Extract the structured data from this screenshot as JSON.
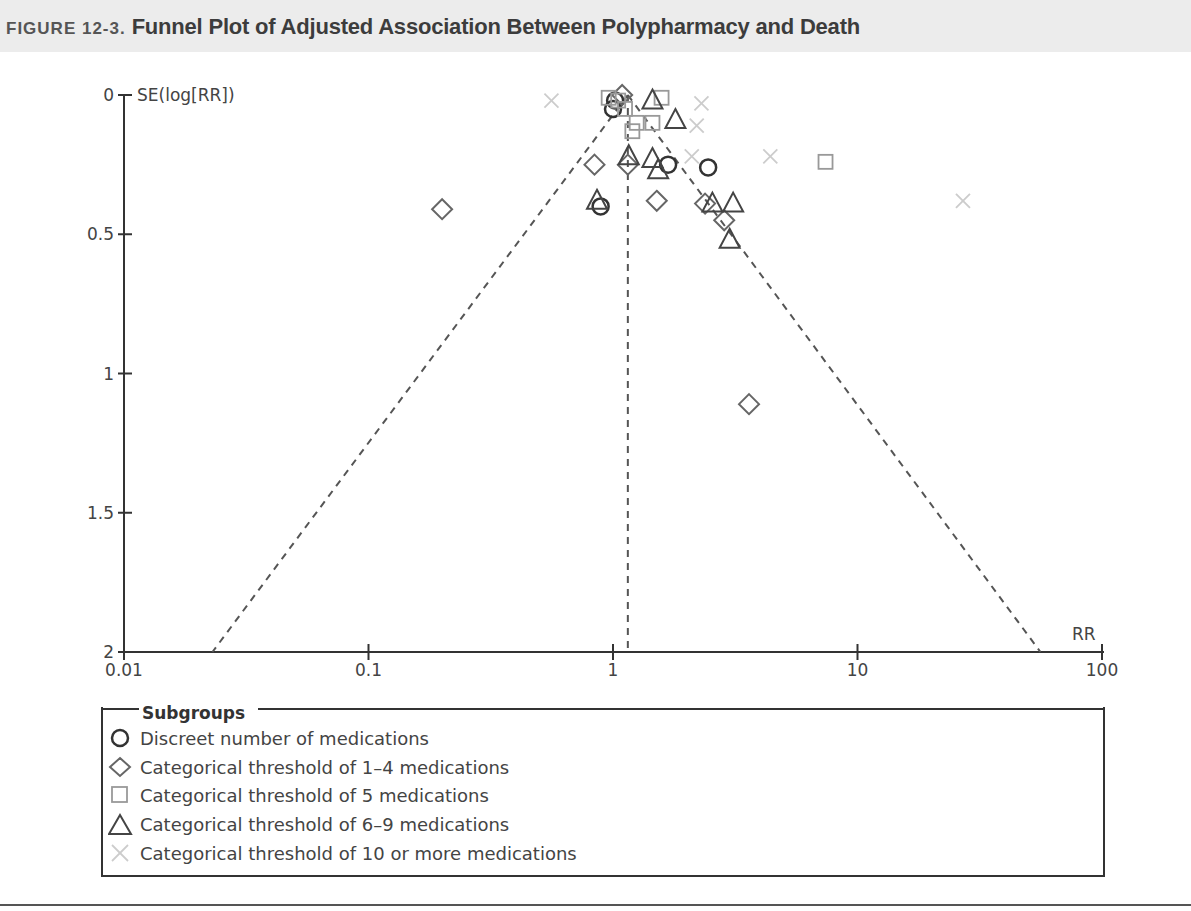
{
  "figure": {
    "label": "FIGURE 12-3.",
    "title": "Funnel Plot of Adjusted Association Between Polypharmacy and Death"
  },
  "axes": {
    "y_label": "SE(log[RR])",
    "x_label": "RR",
    "y_ticks": [
      "0",
      "0.5",
      "1",
      "1.5",
      "2"
    ],
    "x_ticks": [
      "0.01",
      "0.1",
      "1",
      "10",
      "100"
    ]
  },
  "legend": {
    "title": "Subgroups",
    "items": [
      {
        "symbol": "circle",
        "label": "Discreet number of medications",
        "color": "#333333"
      },
      {
        "symbol": "diamond",
        "label": "Categorical threshold of 1–4 medications",
        "color": "#666666"
      },
      {
        "symbol": "square",
        "label": "Categorical threshold of 5 medications",
        "color": "#999999"
      },
      {
        "symbol": "triangle",
        "label": "Categorical threshold of 6–9 medications",
        "color": "#444444"
      },
      {
        "symbol": "cross",
        "label": "Categorical threshold of 10 or more medications",
        "color": "#cccccc"
      }
    ]
  },
  "chart_data": {
    "type": "scatter",
    "title": "Funnel Plot of Adjusted Association Between Polypharmacy and Death",
    "xlabel": "RR",
    "ylabel": "SE(log[RR])",
    "x_scale": "log",
    "xlim": [
      0.01,
      100
    ],
    "ylim": [
      2,
      0
    ],
    "y_inverted": true,
    "x_ticks": [
      0.01,
      0.1,
      1,
      10,
      100
    ],
    "y_ticks": [
      0,
      0.5,
      1,
      1.5,
      2
    ],
    "grid": false,
    "legend_position": "bottom",
    "pooled_estimate_rr": 1.15,
    "funnel_limits": {
      "apex": [
        1.15,
        0
      ],
      "left_at_se2": 0.023,
      "right_at_se2": 56
    },
    "series": [
      {
        "name": "Discreet number of medications",
        "marker": "circle",
        "points": [
          [
            1.0,
            0.05
          ],
          [
            1.02,
            0.02
          ],
          [
            0.89,
            0.4
          ],
          [
            1.68,
            0.25
          ],
          [
            2.45,
            0.26
          ]
        ]
      },
      {
        "name": "Categorical threshold of 1–4 medications",
        "marker": "diamond",
        "points": [
          [
            1.09,
            0.0
          ],
          [
            0.2,
            0.41
          ],
          [
            0.84,
            0.25
          ],
          [
            1.15,
            0.25
          ],
          [
            1.51,
            0.38
          ],
          [
            2.38,
            0.39
          ],
          [
            2.85,
            0.45
          ],
          [
            3.6,
            1.11
          ]
        ]
      },
      {
        "name": "Categorical threshold of 5 medications",
        "marker": "square",
        "points": [
          [
            0.96,
            0.01
          ],
          [
            1.05,
            0.02
          ],
          [
            1.12,
            0.05
          ],
          [
            1.58,
            0.01
          ],
          [
            1.2,
            0.13
          ],
          [
            1.25,
            0.1
          ],
          [
            1.45,
            0.1
          ],
          [
            7.4,
            0.24
          ]
        ]
      },
      {
        "name": "Categorical threshold of 6–9 medications",
        "marker": "triangle",
        "points": [
          [
            0.86,
            0.38
          ],
          [
            1.16,
            0.22
          ],
          [
            1.45,
            0.23
          ],
          [
            1.53,
            0.27
          ],
          [
            1.45,
            0.02
          ],
          [
            1.8,
            0.09
          ],
          [
            2.55,
            0.39
          ],
          [
            3.1,
            0.39
          ],
          [
            3.0,
            0.52
          ]
        ]
      },
      {
        "name": "Categorical threshold of 10 or more medications",
        "marker": "cross",
        "points": [
          [
            0.56,
            0.02
          ],
          [
            2.3,
            0.03
          ],
          [
            2.2,
            0.11
          ],
          [
            2.1,
            0.22
          ],
          [
            4.4,
            0.22
          ],
          [
            27,
            0.38
          ]
        ]
      }
    ]
  }
}
